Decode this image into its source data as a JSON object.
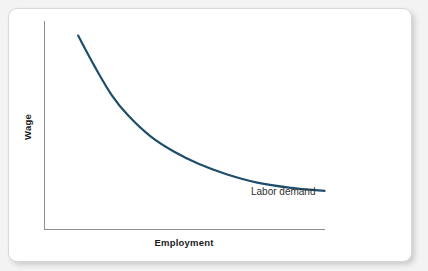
{
  "figure": {
    "background_color": "#f3f3f4",
    "card_color": "#ffffff",
    "card_border_color": "#d8d8da"
  },
  "chart_data": {
    "type": "line",
    "title": "",
    "subtitle": "",
    "xlabel": "Employment",
    "ylabel": "Wage",
    "grid": false,
    "legend_position": "inline-end-of-curve",
    "axis_color": "#8d8f92",
    "series": [
      {
        "name": "Labor demand",
        "color": "#1f4e6b",
        "annotation": "Labor demand",
        "shape": "downward-sloping convex",
        "x": [
          0.12,
          0.18,
          0.24,
          0.3,
          0.38,
          0.46,
          0.55,
          0.65,
          0.76,
          0.88,
          1.0
        ],
        "y": [
          0.93,
          0.78,
          0.645,
          0.545,
          0.445,
          0.375,
          0.315,
          0.265,
          0.225,
          0.2,
          0.185
        ]
      }
    ],
    "xlim": [
      0,
      1
    ],
    "ylim": [
      0,
      1
    ],
    "xticks": [],
    "yticks": [],
    "xticklabels": [],
    "yticklabels": []
  },
  "labels": {
    "y_axis_title": "Wage",
    "x_axis_title": "Employment",
    "curve_label": "Labor demand"
  }
}
